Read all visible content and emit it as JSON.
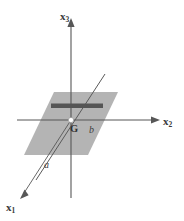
{
  "figure": {
    "type": "3d-coordinate-diagram",
    "labels": {
      "axis_x1": "x",
      "axis_x1_sub": "1",
      "axis_x2": "x",
      "axis_x2_sub": "2",
      "axis_x3": "x",
      "axis_x3_sub": "3",
      "vector_a": "a",
      "vector_b": "b",
      "origin_point": "G"
    },
    "colors": {
      "background": "#ffffff",
      "axis_line": "#575757",
      "plane_fill": "#b3b3b3",
      "bar_fill": "#555555",
      "oblique_line": "#5a5a5a",
      "label_text": "#3a3a3a",
      "origin_marker": "#ffffff"
    },
    "geometry": {
      "origin": [
        71,
        120
      ],
      "x3_axis": [
        [
          71,
          18
        ],
        [
          71,
          198
        ]
      ],
      "x2_axis": [
        [
          17,
          120
        ],
        [
          160,
          120
        ]
      ],
      "x1_axis": [
        [
          71,
          120
        ],
        [
          20,
          199
        ]
      ],
      "oblique_line": [
        [
          105,
          74
        ],
        [
          36,
          180
        ]
      ],
      "plane_vertices": [
        [
          24,
          155
        ],
        [
          54,
          92
        ],
        [
          118,
          92
        ],
        [
          88,
          155
        ]
      ],
      "bar_rect": [
        [
          51,
          104
        ],
        [
          103,
          104
        ],
        [
          103,
          108
        ],
        [
          51,
          108
        ]
      ]
    }
  }
}
